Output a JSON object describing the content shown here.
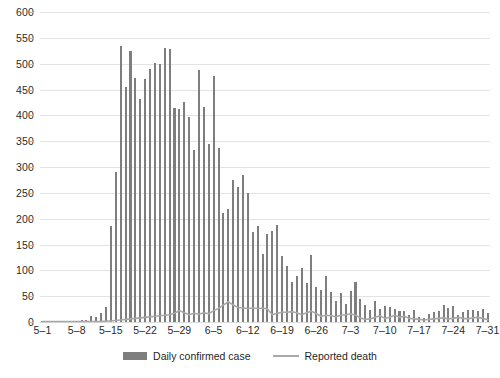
{
  "chart_data": {
    "type": "bar",
    "title": "",
    "subtitle": "",
    "xlabel": "",
    "ylabel": "",
    "ylim": [
      0,
      600
    ],
    "ytick_step": 50,
    "ytick_labels": [
      "0",
      "50",
      "100",
      "150",
      "200",
      "250",
      "300",
      "350",
      "400",
      "450",
      "500",
      "550",
      "600"
    ],
    "grid": true,
    "grid_axis": "y",
    "legend_position": "bottom-center",
    "xtick_labels": [
      "5–1",
      "5–8",
      "5–15",
      "5–22",
      "5–29",
      "6–5",
      "6–12",
      "6–19",
      "6–26",
      "7–3",
      "7–10",
      "7–17",
      "7–24",
      "7–31"
    ],
    "xtick_indices": [
      0,
      7,
      14,
      21,
      28,
      35,
      42,
      49,
      56,
      63,
      70,
      77,
      84,
      91
    ],
    "categories": [
      "5-1",
      "5-2",
      "5-3",
      "5-4",
      "5-5",
      "5-6",
      "5-7",
      "5-8",
      "5-9",
      "5-10",
      "5-11",
      "5-12",
      "5-13",
      "5-14",
      "5-15",
      "5-16",
      "5-17",
      "5-18",
      "5-19",
      "5-20",
      "5-21",
      "5-22",
      "5-23",
      "5-24",
      "5-25",
      "5-26",
      "5-27",
      "5-28",
      "5-29",
      "5-30",
      "5-31",
      "6-1",
      "6-2",
      "6-3",
      "6-4",
      "6-5",
      "6-6",
      "6-7",
      "6-8",
      "6-9",
      "6-10",
      "6-11",
      "6-12",
      "6-13",
      "6-14",
      "6-15",
      "6-16",
      "6-17",
      "6-18",
      "6-19",
      "6-20",
      "6-21",
      "6-22",
      "6-23",
      "6-24",
      "6-25",
      "6-26",
      "6-27",
      "6-28",
      "6-29",
      "6-30",
      "7-1",
      "7-2",
      "7-3",
      "7-4",
      "7-5",
      "7-6",
      "7-7",
      "7-8",
      "7-9",
      "7-10",
      "7-11",
      "7-12",
      "7-13",
      "7-14",
      "7-15",
      "7-16",
      "7-17",
      "7-18",
      "7-19",
      "7-20",
      "7-21",
      "7-22",
      "7-23",
      "7-24",
      "7-25",
      "7-26",
      "7-27",
      "7-28",
      "7-29",
      "7-30",
      "7-31"
    ],
    "series": [
      {
        "name": "Daily confirmed case",
        "render": "bar",
        "color": "#7e7e7e",
        "values": [
          2,
          1,
          2,
          1,
          2,
          1,
          2,
          2,
          3,
          4,
          12,
          9,
          17,
          30,
          185,
          290,
          535,
          455,
          525,
          473,
          432,
          471,
          490,
          501,
          499,
          531,
          528,
          415,
          412,
          425,
          396,
          333,
          488,
          417,
          345,
          476,
          336,
          211,
          219,
          274,
          262,
          285,
          249,
          175,
          186,
          132,
          170,
          177,
          188,
          128,
          109,
          77,
          89,
          104,
          76,
          130,
          67,
          62,
          90,
          59,
          41,
          57,
          35,
          60,
          78,
          44,
          32,
          23,
          41,
          25,
          31,
          30,
          26,
          22,
          21,
          14,
          23,
          9,
          8,
          16,
          19,
          22,
          33,
          28,
          31,
          14,
          20,
          23,
          24,
          21,
          25,
          18
        ]
      },
      {
        "name": "Reported death",
        "render": "line",
        "color": "#a8a8a8",
        "values": [
          1,
          1,
          1,
          1,
          1,
          1,
          1,
          1,
          1,
          1,
          1,
          1,
          1,
          2,
          2,
          3,
          4,
          5,
          6,
          7,
          8,
          9,
          10,
          11,
          12,
          13,
          14,
          17,
          22,
          18,
          14,
          17,
          15,
          18,
          16,
          22,
          26,
          33,
          39,
          33,
          28,
          27,
          26,
          27,
          26,
          27,
          25,
          14,
          17,
          19,
          19,
          20,
          18,
          14,
          18,
          21,
          16,
          11,
          13,
          12,
          10,
          13,
          14,
          16,
          13,
          8,
          5,
          6,
          9,
          12,
          7,
          9,
          13,
          9,
          11,
          7,
          6,
          5,
          4,
          5,
          6,
          7,
          8,
          6,
          7,
          9,
          7,
          6,
          8,
          9,
          7,
          5
        ]
      }
    ]
  },
  "legend": {
    "entries": [
      {
        "label": "Daily confirmed case",
        "marker": "bar-swatch-icon",
        "color": "#7e7e7e"
      },
      {
        "label": "Reported death",
        "marker": "line-swatch-icon",
        "color": "#a8a8a8"
      }
    ]
  }
}
